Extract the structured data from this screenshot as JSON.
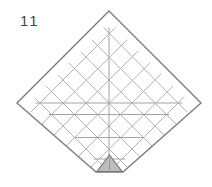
{
  "figure": {
    "step_number": "11",
    "kind": "origami-crease-diagram",
    "canvas": {
      "width": 212,
      "height": 187
    },
    "colors": {
      "background": "#ffffff",
      "outline": "#7e7e7e",
      "crease_diagonal": "#b5b5b5",
      "crease_axis": "#a3a3a3",
      "triangle_fill": "#bdbdbd",
      "triangle_stroke": "#757575",
      "triangle_crease": "#999999",
      "label": "#474747"
    },
    "paper": {
      "outline_points": "109,11 201,103 123,172 96,172 17,103",
      "description": "square paper rotated 45 degrees, bottom tip folded flat"
    },
    "folded_tip": {
      "triangle_points": "109.5,155 122,171.5 97,171.5",
      "crease_line": [
        109.5,
        157,
        109.5,
        170
      ]
    },
    "creases": {
      "diag_up": [
        [
          31,
          112,
          115,
          28
        ],
        [
          42,
          124,
          127,
          40
        ],
        [
          54,
          135,
          138,
          51
        ],
        [
          66,
          146,
          150,
          63
        ],
        [
          78,
          157,
          161,
          74
        ],
        [
          91,
          167,
          173,
          86
        ],
        [
          109,
          172,
          184,
          97
        ]
      ],
      "diag_down": [
        [
          104,
          28,
          187,
          112
        ],
        [
          92,
          40,
          176,
          124
        ],
        [
          81,
          52,
          164,
          135
        ],
        [
          69,
          63,
          152,
          146
        ],
        [
          58,
          75,
          140,
          157
        ],
        [
          46,
          86,
          127,
          167
        ],
        [
          35,
          98,
          109,
          172
        ]
      ],
      "horizontal": [
        [
          36,
          103,
          182,
          103
        ],
        [
          49,
          114.5,
          169,
          114.5
        ],
        [
          75,
          137.5,
          143,
          137.5
        ],
        [
          94,
          159,
          125,
          159
        ]
      ],
      "vertical": [
        [
          109,
          28,
          109,
          170
        ]
      ]
    },
    "stroke_widths": {
      "outline": 1.4,
      "crease": 1,
      "triangle": 1.1
    }
  }
}
